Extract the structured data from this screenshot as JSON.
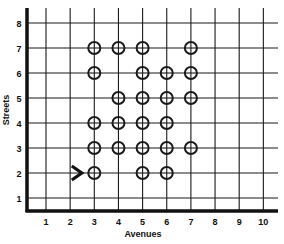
{
  "diagram": {
    "x_axis_label": "Avenues",
    "y_axis_label": "Streets",
    "x_ticks": [
      "1",
      "2",
      "3",
      "4",
      "5",
      "6",
      "7",
      "8",
      "9",
      "10"
    ],
    "y_ticks": [
      "1",
      "2",
      "3",
      "4",
      "5",
      "6",
      "7",
      "8"
    ],
    "colors": {
      "line": "#1a1a1a",
      "background": "#ffffff"
    },
    "marker_icon": "circle-crosshair-icon",
    "start_icon": "chevron-right-arrow-icon",
    "start_position": {
      "avenue": 2.4,
      "street": 2
    },
    "circles": [
      {
        "avenue": 3,
        "street": 7
      },
      {
        "avenue": 4,
        "street": 7
      },
      {
        "avenue": 5,
        "street": 7
      },
      {
        "avenue": 7,
        "street": 7
      },
      {
        "avenue": 3,
        "street": 6
      },
      {
        "avenue": 5,
        "street": 6
      },
      {
        "avenue": 6,
        "street": 6
      },
      {
        "avenue": 7,
        "street": 6
      },
      {
        "avenue": 4,
        "street": 5
      },
      {
        "avenue": 5,
        "street": 5
      },
      {
        "avenue": 6,
        "street": 5
      },
      {
        "avenue": 7,
        "street": 5
      },
      {
        "avenue": 3,
        "street": 4
      },
      {
        "avenue": 4,
        "street": 4
      },
      {
        "avenue": 5,
        "street": 4
      },
      {
        "avenue": 6,
        "street": 4
      },
      {
        "avenue": 3,
        "street": 3
      },
      {
        "avenue": 4,
        "street": 3
      },
      {
        "avenue": 5,
        "street": 3
      },
      {
        "avenue": 6,
        "street": 3
      },
      {
        "avenue": 7,
        "street": 3
      },
      {
        "avenue": 3,
        "street": 2
      },
      {
        "avenue": 5,
        "street": 2
      },
      {
        "avenue": 6,
        "street": 2
      }
    ]
  }
}
